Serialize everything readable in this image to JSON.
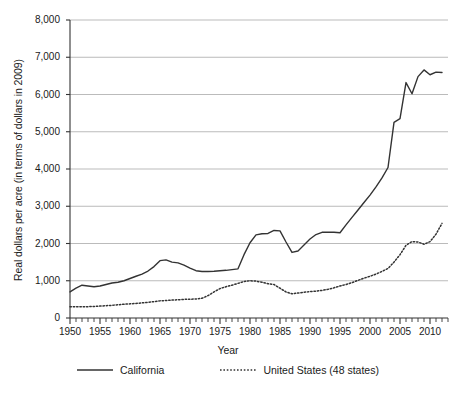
{
  "chart_data": {
    "type": "line",
    "title": "",
    "xlabel": "Year",
    "ylabel": "Real dollars per acre (in terms of dollars in 2009)",
    "xlim": [
      1950,
      2013
    ],
    "ylim": [
      0,
      8000
    ],
    "grid": true,
    "legend_position": "bottom",
    "ytick_labels": [
      "8,000",
      "7,000",
      "6,000",
      "5,000",
      "4,000",
      "3,000",
      "2,000",
      "1,000",
      "0"
    ],
    "ytick_values": [
      8000,
      7000,
      6000,
      5000,
      4000,
      3000,
      2000,
      1000,
      0
    ],
    "xtick_labels": [
      "1950",
      "1955",
      "1960",
      "1965",
      "1970",
      "1975",
      "1980",
      "1985",
      "1990",
      "1995",
      "2000",
      "2005",
      "2010"
    ],
    "xtick_values": [
      1950,
      1955,
      1960,
      1965,
      1970,
      1975,
      1980,
      1985,
      1990,
      1995,
      2000,
      2005,
      2010
    ],
    "minor_xtick_interval": 1,
    "x": [
      1950,
      1951,
      1952,
      1953,
      1954,
      1955,
      1956,
      1957,
      1958,
      1959,
      1960,
      1961,
      1962,
      1963,
      1964,
      1965,
      1966,
      1967,
      1968,
      1969,
      1970,
      1971,
      1972,
      1973,
      1974,
      1975,
      1976,
      1977,
      1978,
      1979,
      1980,
      1981,
      1982,
      1983,
      1984,
      1985,
      1986,
      1987,
      1988,
      1989,
      1990,
      1991,
      1992,
      1993,
      1994,
      1995,
      1996,
      1997,
      1998,
      1999,
      2000,
      2001,
      2002,
      2003,
      2004,
      2005,
      2006,
      2007,
      2008,
      2009,
      2010,
      2011,
      2012
    ],
    "series": [
      {
        "name": "California",
        "style": "solid",
        "color": "#333333",
        "values": [
          700,
          800,
          880,
          860,
          840,
          860,
          900,
          940,
          960,
          1000,
          1060,
          1120,
          1180,
          1260,
          1380,
          1540,
          1560,
          1500,
          1480,
          1420,
          1340,
          1270,
          1250,
          1250,
          1255,
          1270,
          1280,
          1300,
          1320,
          1700,
          2020,
          2230,
          2260,
          2270,
          2350,
          2340,
          2040,
          1760,
          1800,
          1960,
          2120,
          2240,
          2300,
          2300,
          2300,
          2290,
          2500,
          2700,
          2900,
          3100,
          3300,
          3520,
          3760,
          4040,
          5250,
          5350,
          6320,
          6020,
          6480,
          6660,
          6530,
          6600,
          6590
        ]
      },
      {
        "name": "United States (48 states)",
        "style": "dotted",
        "color": "#333333",
        "values": [
          300,
          300,
          305,
          305,
          310,
          320,
          330,
          340,
          355,
          370,
          380,
          390,
          405,
          420,
          440,
          460,
          470,
          480,
          490,
          500,
          505,
          510,
          530,
          600,
          700,
          790,
          840,
          880,
          930,
          980,
          1000,
          990,
          960,
          920,
          900,
          800,
          700,
          650,
          670,
          690,
          710,
          720,
          740,
          770,
          810,
          860,
          900,
          950,
          1010,
          1070,
          1120,
          1180,
          1250,
          1330,
          1500,
          1700,
          1950,
          2050,
          2040,
          1980,
          2050,
          2250,
          2540
        ]
      }
    ]
  },
  "legend": {
    "entries": [
      {
        "label": "California"
      },
      {
        "label": "United States (48 states)"
      }
    ]
  }
}
